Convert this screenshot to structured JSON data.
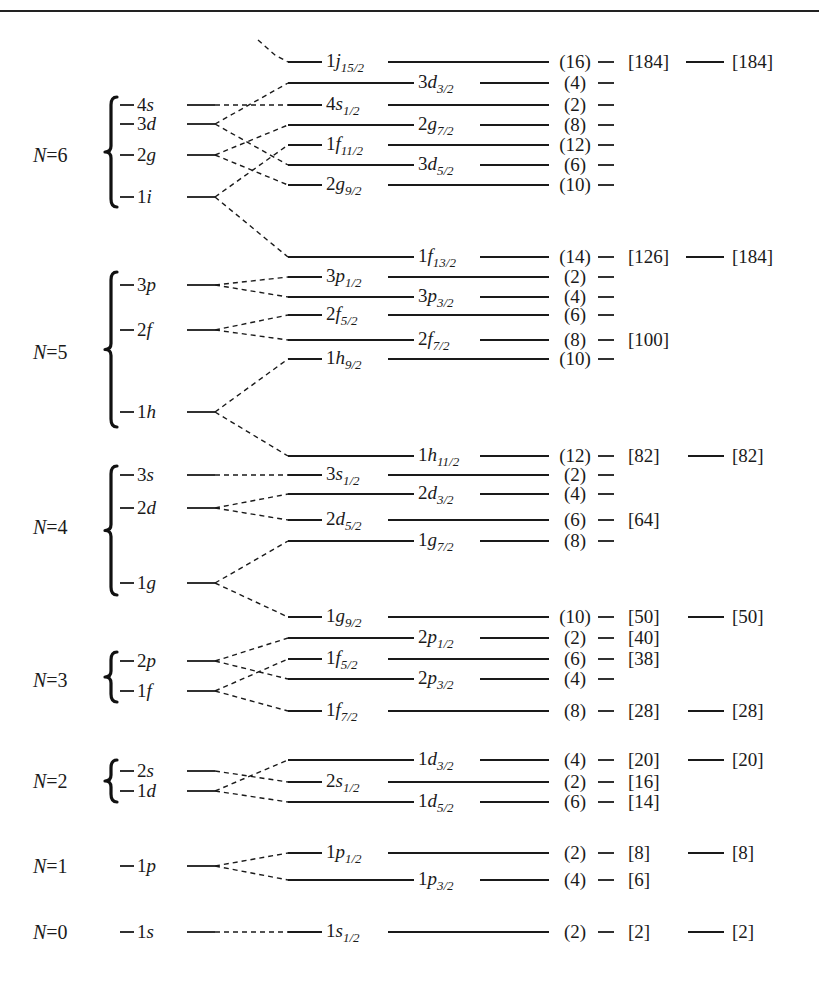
{
  "chart_data": {
    "type": "diagram",
    "shells": [
      {
        "name": "N=0",
        "y": 932,
        "brace": false,
        "orbitals": [
          {
            "label": "1s",
            "n": "1",
            "l": "s",
            "y": 932,
            "splits": [
              "1s1/2"
            ]
          }
        ]
      },
      {
        "name": "N=1",
        "y": 866,
        "brace": false,
        "orbitals": [
          {
            "label": "1p",
            "n": "1",
            "l": "p",
            "y": 866,
            "splits": [
              "1p1/2",
              "1p3/2"
            ]
          }
        ]
      },
      {
        "name": "N=2",
        "y": 781,
        "brace": true,
        "braceTop": 760,
        "braceBot": 802,
        "orbitals": [
          {
            "label": "2s",
            "n": "2",
            "l": "s",
            "y": 771,
            "splits": [
              "2s1/2"
            ]
          },
          {
            "label": "1d",
            "n": "1",
            "l": "d",
            "y": 791,
            "splits": [
              "1d3/2",
              "1d5/2"
            ]
          }
        ]
      },
      {
        "name": "N=3",
        "y": 680,
        "brace": true,
        "braceTop": 652,
        "braceBot": 702,
        "orbitals": [
          {
            "label": "2p",
            "n": "2",
            "l": "p",
            "y": 661,
            "splits": [
              "2p1/2",
              "2p3/2"
            ]
          },
          {
            "label": "1f",
            "n": "1",
            "l": "f",
            "y": 691,
            "splits": [
              "1f5/2",
              "1f7/2"
            ]
          }
        ]
      },
      {
        "name": "N=4",
        "y": 527,
        "brace": true,
        "braceTop": 466,
        "braceBot": 595,
        "orbitals": [
          {
            "label": "3s",
            "n": "3",
            "l": "s",
            "y": 475,
            "splits": [
              "3s1/2"
            ]
          },
          {
            "label": "2d",
            "n": "2",
            "l": "d",
            "y": 508,
            "splits": [
              "2d3/2",
              "2d5/2"
            ]
          },
          {
            "label": "1g",
            "n": "1",
            "l": "g",
            "y": 583,
            "splits": [
              "1g7/2",
              "1g9/2"
            ]
          }
        ]
      },
      {
        "name": "N=5",
        "y": 352,
        "brace": true,
        "braceTop": 272,
        "braceBot": 427,
        "orbitals": [
          {
            "label": "3p",
            "n": "3",
            "l": "p",
            "y": 285,
            "splits": [
              "3p1/2",
              "3p3/2"
            ]
          },
          {
            "label": "2f",
            "n": "2",
            "l": "f",
            "y": 330,
            "splits": [
              "2f5/2",
              "2f7/2"
            ]
          },
          {
            "label": "1h",
            "n": "1",
            "l": "h",
            "y": 412,
            "splits": [
              "1h9/2",
              "1h11/2"
            ]
          }
        ]
      },
      {
        "name": "N=6",
        "y": 155,
        "brace": true,
        "braceTop": 97,
        "braceBot": 207,
        "orbitals": [
          {
            "label": "4s",
            "n": "4",
            "l": "s",
            "y": 105,
            "splits": [
              "4s1/2"
            ]
          },
          {
            "label": "3d",
            "n": "3",
            "l": "d",
            "y": 124,
            "splits": [
              "3d3/2",
              "3d5/2"
            ]
          },
          {
            "label": "2g",
            "n": "2",
            "l": "g",
            "y": 155,
            "splits": [
              "2g7/2",
              "2g9/2"
            ]
          },
          {
            "label": "1i",
            "n": "1",
            "l": "i",
            "y": 197,
            "splits": [
              "1f11/2",
              "1f13/2"
            ]
          }
        ]
      }
    ],
    "levels": [
      {
        "id": "1j15/2",
        "n": "1",
        "l": "j",
        "j": "15/2",
        "y": 62,
        "labelPos": "left",
        "degeneracy": "(16)",
        "cumulative": "[184]",
        "magic": "[184]",
        "incoming": "top"
      },
      {
        "id": "3d3/2",
        "n": "3",
        "l": "d",
        "j": "3/2",
        "y": 83,
        "labelPos": "right",
        "degeneracy": "(4)",
        "cumulative": "",
        "magic": ""
      },
      {
        "id": "4s1/2",
        "n": "4",
        "l": "s",
        "j": "1/2",
        "y": 105,
        "labelPos": "left",
        "degeneracy": "(2)",
        "cumulative": "",
        "magic": ""
      },
      {
        "id": "2g7/2",
        "n": "2",
        "l": "g",
        "j": "7/2",
        "y": 125,
        "labelPos": "right",
        "degeneracy": "(8)",
        "cumulative": "",
        "magic": ""
      },
      {
        "id": "1f11/2",
        "n": "1",
        "l": "f",
        "j": "11/2",
        "y": 145,
        "labelPos": "left",
        "degeneracy": "(12)",
        "cumulative": "",
        "magic": ""
      },
      {
        "id": "3d5/2",
        "n": "3",
        "l": "d",
        "j": "5/2",
        "y": 165,
        "labelPos": "right",
        "degeneracy": "(6)",
        "cumulative": "",
        "magic": ""
      },
      {
        "id": "2g9/2",
        "n": "2",
        "l": "g",
        "j": "9/2",
        "y": 185,
        "labelPos": "left",
        "degeneracy": "(10)",
        "cumulative": "",
        "magic": ""
      },
      {
        "id": "1f13/2",
        "n": "1",
        "l": "f",
        "j": "13/2",
        "y": 257,
        "labelPos": "right",
        "degeneracy": "(14)",
        "cumulative": "[126]",
        "magic": "[184]"
      },
      {
        "id": "3p1/2",
        "n": "3",
        "l": "p",
        "j": "1/2",
        "y": 277,
        "labelPos": "left",
        "degeneracy": "(2)",
        "cumulative": "",
        "magic": ""
      },
      {
        "id": "3p3/2",
        "n": "3",
        "l": "p",
        "j": "3/2",
        "y": 297,
        "labelPos": "right",
        "degeneracy": "(4)",
        "cumulative": "",
        "magic": ""
      },
      {
        "id": "2f5/2",
        "n": "2",
        "l": "f",
        "j": "5/2",
        "y": 315,
        "labelPos": "left",
        "degeneracy": "(6)",
        "cumulative": "",
        "magic": ""
      },
      {
        "id": "2f7/2",
        "n": "2",
        "l": "f",
        "j": "7/2",
        "y": 340,
        "labelPos": "right",
        "degeneracy": "(8)",
        "cumulative": "[100]",
        "magic": ""
      },
      {
        "id": "1h9/2",
        "n": "1",
        "l": "h",
        "j": "9/2",
        "y": 359,
        "labelPos": "left",
        "degeneracy": "(10)",
        "cumulative": "",
        "magic": ""
      },
      {
        "id": "1h11/2",
        "n": "1",
        "l": "h",
        "j": "11/2",
        "y": 456,
        "labelPos": "right",
        "degeneracy": "(12)",
        "cumulative": "[82]",
        "magic": "[82]"
      },
      {
        "id": "3s1/2",
        "n": "3",
        "l": "s",
        "j": "1/2",
        "y": 475,
        "labelPos": "left",
        "degeneracy": "(2)",
        "cumulative": "",
        "magic": ""
      },
      {
        "id": "2d3/2",
        "n": "2",
        "l": "d",
        "j": "3/2",
        "y": 494,
        "labelPos": "right",
        "degeneracy": "(4)",
        "cumulative": "",
        "magic": ""
      },
      {
        "id": "2d5/2",
        "n": "2",
        "l": "d",
        "j": "5/2",
        "y": 520,
        "labelPos": "left",
        "degeneracy": "(6)",
        "cumulative": "[64]",
        "magic": ""
      },
      {
        "id": "1g7/2",
        "n": "1",
        "l": "g",
        "j": "7/2",
        "y": 541,
        "labelPos": "right",
        "degeneracy": "(8)",
        "cumulative": "",
        "magic": ""
      },
      {
        "id": "1g9/2",
        "n": "1",
        "l": "g",
        "j": "9/2",
        "y": 617,
        "labelPos": "left",
        "degeneracy": "(10)",
        "cumulative": "[50]",
        "magic": "[50]"
      },
      {
        "id": "2p1/2",
        "n": "2",
        "l": "p",
        "j": "1/2",
        "y": 638,
        "labelPos": "right",
        "degeneracy": "(2)",
        "cumulative": "[40]",
        "magic": ""
      },
      {
        "id": "1f5/2",
        "n": "1",
        "l": "f",
        "j": "5/2",
        "y": 659,
        "labelPos": "left",
        "degeneracy": "(6)",
        "cumulative": "[38]",
        "magic": ""
      },
      {
        "id": "2p3/2",
        "n": "2",
        "l": "p",
        "j": "3/2",
        "y": 679,
        "labelPos": "right",
        "degeneracy": "(4)",
        "cumulative": "",
        "magic": ""
      },
      {
        "id": "1f7/2",
        "n": "1",
        "l": "f",
        "j": "7/2",
        "y": 711,
        "labelPos": "left",
        "degeneracy": "(8)",
        "cumulative": "[28]",
        "magic": "[28]"
      },
      {
        "id": "1d3/2",
        "n": "1",
        "l": "d",
        "j": "3/2",
        "y": 760,
        "labelPos": "right",
        "degeneracy": "(4)",
        "cumulative": "[20]",
        "magic": "[20]"
      },
      {
        "id": "2s1/2",
        "n": "2",
        "l": "s",
        "j": "1/2",
        "y": 782,
        "labelPos": "left",
        "degeneracy": "(2)",
        "cumulative": "[16]",
        "magic": ""
      },
      {
        "id": "1d5/2",
        "n": "1",
        "l": "d",
        "j": "5/2",
        "y": 802,
        "labelPos": "right",
        "degeneracy": "(6)",
        "cumulative": "[14]",
        "magic": ""
      },
      {
        "id": "1p1/2",
        "n": "1",
        "l": "p",
        "j": "1/2",
        "y": 853,
        "labelPos": "left",
        "degeneracy": "(2)",
        "cumulative": "[8]",
        "magic": "[8]"
      },
      {
        "id": "1p3/2",
        "n": "1",
        "l": "p",
        "j": "3/2",
        "y": 880,
        "labelPos": "right",
        "degeneracy": "(4)",
        "cumulative": "[6]",
        "magic": ""
      },
      {
        "id": "1s1/2",
        "n": "1",
        "l": "s",
        "j": "1/2",
        "y": 932,
        "labelPos": "left",
        "degeneracy": "(2)",
        "cumulative": "[2]",
        "magic": "[2]"
      }
    ],
    "connections": [
      {
        "from": "4s",
        "to": "4s1/2"
      },
      {
        "from": "3d",
        "to": "3d3/2"
      },
      {
        "from": "3d",
        "to": "3d5/2"
      },
      {
        "from": "2g",
        "to": "2g7/2"
      },
      {
        "from": "2g",
        "to": "2g9/2"
      },
      {
        "from": "1i",
        "to": "1f11/2"
      },
      {
        "from": "1i",
        "to": "1f13/2"
      },
      {
        "from": "3p",
        "to": "3p1/2"
      },
      {
        "from": "3p",
        "to": "3p3/2"
      },
      {
        "from": "2f",
        "to": "2f5/2"
      },
      {
        "from": "2f",
        "to": "2f7/2"
      },
      {
        "from": "1h",
        "to": "1h9/2"
      },
      {
        "from": "1h",
        "to": "1h11/2"
      },
      {
        "from": "3s",
        "to": "3s1/2"
      },
      {
        "from": "2d",
        "to": "2d3/2"
      },
      {
        "from": "2d",
        "to": "2d5/2"
      },
      {
        "from": "1g",
        "to": "1g7/2"
      },
      {
        "from": "1g",
        "to": "1g9/2"
      },
      {
        "from": "2p",
        "to": "2p1/2"
      },
      {
        "from": "2p",
        "to": "2p3/2"
      },
      {
        "from": "1f",
        "to": "1f5/2"
      },
      {
        "from": "1f",
        "to": "1f7/2"
      },
      {
        "from": "2s",
        "to": "2s1/2"
      },
      {
        "from": "1d",
        "to": "1d3/2"
      },
      {
        "from": "1d",
        "to": "1d5/2"
      },
      {
        "from": "1p",
        "to": "1p1/2"
      },
      {
        "from": "1p",
        "to": "1p3/2"
      },
      {
        "from": "1s",
        "to": "1s1/2"
      }
    ],
    "magic_numbers": [
      "[2]",
      "[8]",
      "[20]",
      "[28]",
      "[50]",
      "[82]",
      "[184]",
      "[184]"
    ],
    "xlabel": "",
    "ylabel": "",
    "grid": false
  }
}
